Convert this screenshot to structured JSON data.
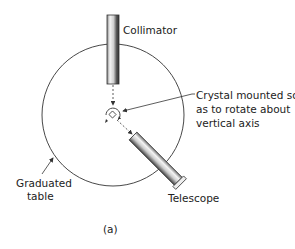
{
  "diagram": {
    "labels": {
      "collimator": "Collimator",
      "crystal_line1": "Crystal mounted so",
      "crystal_line2": "as to rotate about",
      "crystal_line3": "vertical axis",
      "table_line1": "Graduated",
      "table_line2": "table",
      "telescope": "Telescope",
      "caption": "(a)"
    },
    "colors": {
      "stroke": "#333333",
      "tube_light": "#f2f2f2",
      "tube_dark": "#555555"
    }
  }
}
